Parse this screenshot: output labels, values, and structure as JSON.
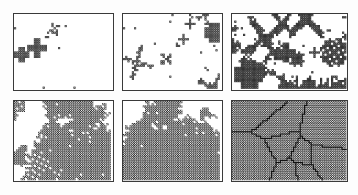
{
  "figure": {
    "type": "simulation-snapshot-grid",
    "rows": 2,
    "cols": 3,
    "background_color": "#ffffff",
    "border_color": "#3a3a3a",
    "motif_color": "#2b2b2b",
    "caption": ""
  },
  "panels": [
    {
      "id": "panel-1",
      "name": "panel-stage-1",
      "label": "",
      "x": 13,
      "y": 13,
      "w": 101,
      "h": 78,
      "coverage_percent": 4,
      "seed": 10137,
      "n_clusters": 9,
      "cluster_sizes": [
        1,
        1,
        1,
        1,
        1,
        2,
        3,
        14,
        16
      ],
      "fill_style": "outline-cells",
      "cell_px": 2.2,
      "has_grain_boundaries": false,
      "description": "sparse isolated cross-shaped nuclei and single cells"
    },
    {
      "id": "panel-2",
      "name": "panel-stage-2",
      "label": "",
      "x": 122,
      "y": 13,
      "w": 101,
      "h": 78,
      "coverage_percent": 9,
      "seed": 20241,
      "n_clusters": 26,
      "cluster_sizes": [
        1,
        1,
        1,
        1,
        1,
        1,
        1,
        1,
        1,
        1,
        1,
        1,
        1,
        1,
        1,
        2,
        2,
        2,
        3,
        4,
        6,
        9,
        18,
        22,
        24,
        28
      ],
      "fill_style": "outline-cells",
      "cell_px": 2.2,
      "has_grain_boundaries": false,
      "description": "more nuclei, crosses thicken, scattered monomers"
    },
    {
      "id": "panel-3",
      "name": "panel-stage-3",
      "label": "",
      "x": 231,
      "y": 13,
      "w": 117,
      "h": 78,
      "coverage_percent": 20,
      "seed": 30553,
      "n_clusters": 48,
      "cluster_sizes": [
        1,
        1,
        1,
        1,
        1,
        1,
        1,
        1,
        1,
        1,
        2,
        2,
        2,
        2,
        3,
        3,
        4,
        5,
        6,
        8,
        10,
        12,
        14,
        18,
        22,
        26,
        30,
        34,
        40,
        46,
        52,
        60
      ],
      "fill_style": "half-filled-cells",
      "cell_px": 2.2,
      "has_grain_boundaries": false,
      "dense_band": {
        "present": true,
        "y_frac": 0.8,
        "height_frac": 0.2
      },
      "description": "many elongated clusters plus a dense striped band along the lower edge"
    },
    {
      "id": "panel-4",
      "name": "panel-stage-4",
      "label": "",
      "x": 13,
      "y": 100,
      "w": 101,
      "h": 82,
      "coverage_percent": 48,
      "seed": 40817,
      "n_clusters": 17,
      "cluster_sizes": [
        4,
        6,
        9,
        14,
        22,
        40,
        58,
        86,
        120,
        150,
        190,
        230,
        270,
        310,
        360,
        410,
        470
      ],
      "fill_style": "checker-filled",
      "cell_px": 2.2,
      "has_grain_boundaries": false,
      "description": "large coalescing checkerboard-textured islands separated by white channels"
    },
    {
      "id": "panel-5",
      "name": "panel-stage-5",
      "label": "",
      "x": 122,
      "y": 100,
      "w": 101,
      "h": 82,
      "coverage_percent": 66,
      "seed": 50929,
      "n_clusters": 11,
      "cluster_sizes": [
        20,
        45,
        90,
        160,
        230,
        320,
        420,
        520,
        640,
        760,
        900
      ],
      "fill_style": "checker-filled",
      "cell_px": 2.2,
      "has_grain_boundaries": false,
      "description": "islands merged into large faceted domains, thin white grooves remain"
    },
    {
      "id": "panel-6",
      "name": "panel-stage-6",
      "label": "",
      "x": 231,
      "y": 100,
      "w": 117,
      "h": 82,
      "coverage_percent": 100,
      "seed": 60311,
      "n_clusters": 9,
      "cluster_sizes": [],
      "fill_style": "checker-filled",
      "cell_px": 2.2,
      "has_grain_boundaries": true,
      "n_grains": 9,
      "description": "fully covered lattice, polycrystalline with dark grain-boundary network"
    }
  ]
}
